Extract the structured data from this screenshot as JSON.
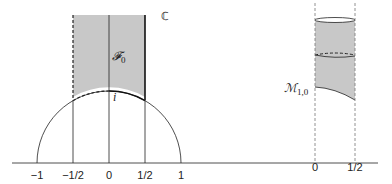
{
  "figure": {
    "left": {
      "tick_labels": [
        "−1",
        "−1/2",
        "0",
        "1/2",
        "1"
      ],
      "region_label": "𝓕",
      "region_subscript": "0",
      "point_label": "i",
      "corner_label": "ℂ"
    },
    "right": {
      "tick_labels": [
        "0",
        "1/2"
      ],
      "region_label": "ℳ",
      "region_subscript": "1,0"
    },
    "fill_color": "#c8c8c8",
    "line_color": "#222222"
  }
}
